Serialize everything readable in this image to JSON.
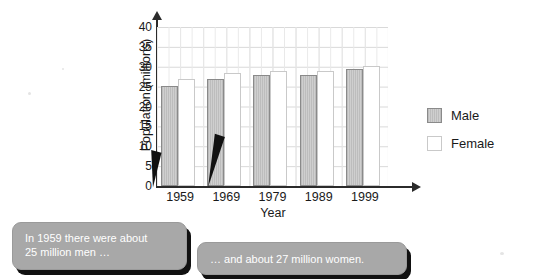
{
  "chart_data": {
    "type": "bar",
    "title": "",
    "xlabel": "Year",
    "ylabel": "Population (millions)",
    "categories": [
      "1959",
      "1969",
      "1979",
      "1989",
      "1999"
    ],
    "series": [
      {
        "name": "Male",
        "color": "#c4c4c4",
        "values": [
          25.2,
          27.0,
          28.0,
          28.0,
          29.5
        ]
      },
      {
        "name": "Female",
        "color": "#ffffff",
        "values": [
          27.0,
          28.5,
          29.0,
          29.0,
          30.3
        ]
      }
    ],
    "ylim": [
      0,
      40
    ],
    "ytick_labels": [
      "40",
      "35",
      "30",
      "25",
      "20",
      "15",
      "10",
      "5",
      "0"
    ],
    "ytick_values": [
      40,
      35,
      30,
      25,
      20,
      15,
      10,
      5,
      0
    ],
    "grid": true,
    "legend_position": "right",
    "annotations": [
      "In 1959 there were about 25 million men …",
      "… and about 27 million women."
    ]
  },
  "axes": {
    "y_title": "Population (millions)",
    "x_title": "Year"
  },
  "legend": {
    "items": [
      {
        "label": "Male",
        "swatch": "male-swatch"
      },
      {
        "label": "Female",
        "swatch": "female-swatch"
      }
    ]
  },
  "callouts": {
    "first": {
      "line1": "In 1959 there were about",
      "line2": "25 million men …"
    },
    "second": {
      "line1": "… and about 27 million women."
    }
  },
  "title_sliver": "",
  "colors": {
    "male_fill": "#c4c4c4",
    "male_border": "#8a8a8a",
    "female_fill": "#ffffff",
    "female_border": "#c9c9c9",
    "axis": "#2b2b2b",
    "grid": "#d8d8d8",
    "callout_bg": "#a8a8a8",
    "callout_text": "#ffffff",
    "callout_shadow": "#111111"
  }
}
